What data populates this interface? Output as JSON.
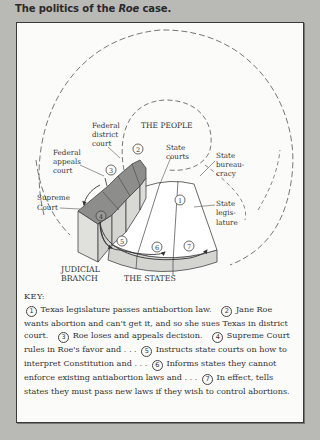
{
  "caption": {
    "prefix": "The politics of the ",
    "italic": "Roe",
    "suffix": " case."
  },
  "diagram": {
    "labels": {
      "the_people": "THE PEOPLE",
      "federal_district_court": [
        "Federal",
        "district",
        "court"
      ],
      "federal_appeals_court": [
        "Federal",
        "appeals",
        "court"
      ],
      "supreme_court": [
        "Supreme",
        "Court"
      ],
      "state_courts": [
        "State",
        "courts"
      ],
      "state_bureaucracy": [
        "State",
        "bureau-",
        "cracy"
      ],
      "state_legislature": [
        "State",
        "legis-",
        "lature"
      ],
      "judicial_branch": [
        "JUDICIAL",
        "BRANCH"
      ],
      "the_states": "THE STATES"
    },
    "step_markers": [
      "1",
      "2",
      "3",
      "4",
      "5",
      "6",
      "7"
    ],
    "colors": {
      "court_top": "#8d8d8b",
      "court_side": "#d9d9d6",
      "states_face": "#ffffff",
      "states_rim": "#d4d4d1",
      "line": "#444444"
    }
  },
  "key": {
    "title": "KEY:",
    "items": [
      {
        "n": "1",
        "text": "Texas legislature passes antiabortion law."
      },
      {
        "n": "2",
        "text": "Jane Roe wants abortion and can't get it, and so she sues Texas in district court."
      },
      {
        "n": "3",
        "text": "Roe loses and appeals decision."
      },
      {
        "n": "4",
        "text": "Supreme Court rules in Roe's favor and . . ."
      },
      {
        "n": "5",
        "text": "Instructs state courts on how to interpret Constitution and . . ."
      },
      {
        "n": "6",
        "text": "Informs states they cannot enforce existing antiabortion laws and . . ."
      },
      {
        "n": "7",
        "text": "In effect, tells states they must pass new laws if they wish to control abortions."
      }
    ]
  }
}
